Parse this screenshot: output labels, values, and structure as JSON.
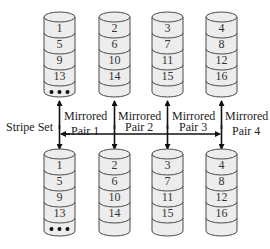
{
  "diagram": {
    "type": "RAID 10 (mirrored pairs striped)",
    "stripe_label": "Stripe Set",
    "colors": {
      "disk_fill": "#ededed",
      "disk_stroke": "#4a4a4a",
      "arrow": "#111111"
    },
    "pairs": [
      {
        "label_line1": "Mirrored",
        "label_line2": "Pair 1",
        "blocks": [
          "1",
          "5",
          "9",
          "13"
        ],
        "ellipsis": true
      },
      {
        "label_line1": "Mirrored",
        "label_line2": "Pair 2",
        "blocks": [
          "2",
          "6",
          "10",
          "14"
        ],
        "ellipsis": false
      },
      {
        "label_line1": "Mirrored",
        "label_line2": "Pair 3",
        "blocks": [
          "3",
          "7",
          "11",
          "15"
        ],
        "ellipsis": false
      },
      {
        "label_line1": "Mirrored",
        "label_line2": "Pair 4",
        "blocks": [
          "4",
          "8",
          "12",
          "16"
        ],
        "ellipsis": false
      }
    ]
  }
}
